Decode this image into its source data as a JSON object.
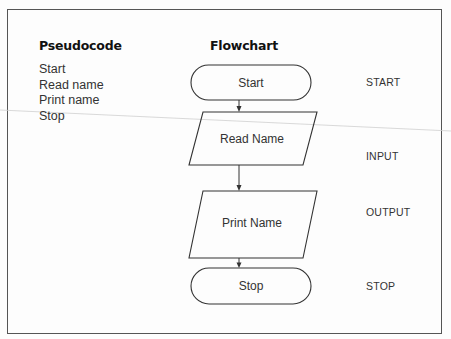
{
  "headings": {
    "pseudocode": "Pseudocode",
    "flowchart": "Flowchart"
  },
  "pseudocode": {
    "lines": [
      "Start",
      "Read name",
      "Print name",
      "Stop"
    ]
  },
  "flowchart": {
    "nodes": [
      {
        "id": "start",
        "shape": "terminator",
        "text": "Start",
        "type_label": "START"
      },
      {
        "id": "read",
        "shape": "parallelogram",
        "text": "Read Name",
        "type_label": "INPUT"
      },
      {
        "id": "print",
        "shape": "parallelogram",
        "text": "Print Name",
        "type_label": "OUTPUT"
      },
      {
        "id": "stop",
        "shape": "terminator",
        "text": "Stop",
        "type_label": "STOP"
      }
    ],
    "edges": [
      {
        "from": "start",
        "to": "read"
      },
      {
        "from": "read",
        "to": "print"
      },
      {
        "from": "print",
        "to": "stop"
      }
    ]
  },
  "colors": {
    "stroke": "#333333",
    "background": "#fdfdfd"
  }
}
